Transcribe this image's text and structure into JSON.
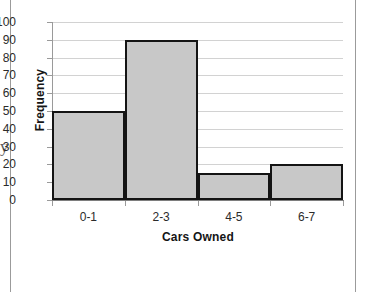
{
  "frame": {
    "edge_glyph": "y",
    "background_color": "#ffffff",
    "rule_color": "#9b9b9b"
  },
  "chart_data": {
    "type": "bar",
    "title": "",
    "subtitle": "",
    "xlabel": "Cars Owned",
    "ylabel": "Frequency",
    "categories": [
      "0-1",
      "2-3",
      "4-5",
      "6-7"
    ],
    "values": [
      50,
      90,
      15,
      20
    ],
    "series": [
      {
        "name": "Frequency",
        "values": [
          50,
          90,
          15,
          20
        ]
      }
    ],
    "ylim": [
      0,
      100
    ],
    "ytick_labels": [
      "100",
      "90",
      "80",
      "70",
      "60",
      "50",
      "40",
      "30",
      "20",
      "10",
      "0"
    ],
    "ytick_values": [
      100,
      90,
      80,
      70,
      60,
      50,
      40,
      30,
      20,
      10,
      0
    ],
    "ytick_step": 10,
    "grid": true,
    "grid_axis": "y",
    "legend": false,
    "legend_position": "none",
    "bar_gap": 0,
    "annotations": [],
    "colors": {
      "bar_fill": "#c8c8c8",
      "bar_border": "#141414",
      "gridline": "#d2d2d2",
      "axis": "#9a9a9a",
      "text": "#2b2b2b",
      "title_text": "#151515"
    }
  }
}
